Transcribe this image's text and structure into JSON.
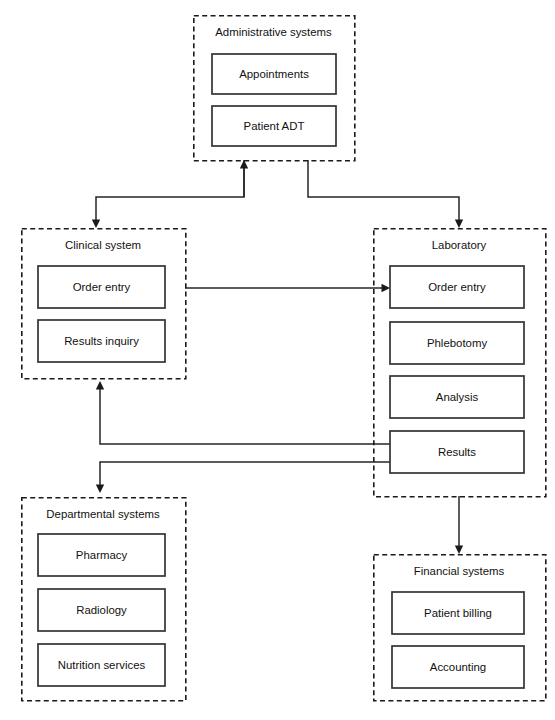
{
  "diagram": {
    "colors": {
      "background": "#ffffff",
      "group_border": "#1a1a1a",
      "node_border": "#333333",
      "node_fill": "#ffffff",
      "connector": "#262626",
      "text": "#111111"
    },
    "groups": [
      {
        "id": "administrative-systems",
        "title": "Administrative systems",
        "x": 193,
        "y": 15,
        "w": 161,
        "h": 145,
        "title_x": 273.5,
        "title_y": 33,
        "nodes": [
          {
            "id": "appointments",
            "label": "Appointments",
            "x": 212,
            "y": 54,
            "w": 124,
            "h": 40
          },
          {
            "id": "patient-adt",
            "label": "Patient ADT",
            "x": 212,
            "y": 106,
            "w": 124,
            "h": 40
          }
        ]
      },
      {
        "id": "clinical-system",
        "title": "Clinical system",
        "x": 21,
        "y": 228,
        "w": 164,
        "h": 150,
        "title_x": 103,
        "title_y": 246,
        "nodes": [
          {
            "id": "clinical-order-entry",
            "label": "Order entry",
            "x": 38,
            "y": 266,
            "w": 127,
            "h": 42
          },
          {
            "id": "results-inquiry",
            "label": "Results inquiry",
            "x": 38,
            "y": 320,
            "w": 127,
            "h": 42
          }
        ]
      },
      {
        "id": "laboratory",
        "title": "Laboratory",
        "x": 373,
        "y": 228,
        "w": 172,
        "h": 268,
        "title_x": 459,
        "title_y": 246,
        "nodes": [
          {
            "id": "lab-order-entry",
            "label": "Order entry",
            "x": 390,
            "y": 266,
            "w": 134,
            "h": 42
          },
          {
            "id": "phlebotomy",
            "label": "Phlebotomy",
            "x": 390,
            "y": 322,
            "w": 134,
            "h": 42
          },
          {
            "id": "analysis",
            "label": "Analysis",
            "x": 390,
            "y": 376,
            "w": 134,
            "h": 42
          },
          {
            "id": "results",
            "label": "Results",
            "x": 390,
            "y": 431,
            "w": 134,
            "h": 42
          }
        ]
      },
      {
        "id": "departmental-systems",
        "title": "Departmental systems",
        "x": 21,
        "y": 497,
        "w": 164,
        "h": 203,
        "title_x": 103,
        "title_y": 515,
        "nodes": [
          {
            "id": "pharmacy",
            "label": "Pharmacy",
            "x": 38,
            "y": 534,
            "w": 127,
            "h": 42
          },
          {
            "id": "radiology",
            "label": "Radiology",
            "x": 38,
            "y": 589,
            "w": 127,
            "h": 42
          },
          {
            "id": "nutrition-services",
            "label": "Nutrition services",
            "x": 38,
            "y": 644,
            "w": 127,
            "h": 42
          }
        ]
      },
      {
        "id": "financial-systems",
        "title": "Financial systems",
        "x": 373,
        "y": 554,
        "w": 172,
        "h": 146,
        "title_x": 459,
        "title_y": 572,
        "nodes": [
          {
            "id": "patient-billing",
            "label": "Patient billing",
            "x": 392,
            "y": 592,
            "w": 132,
            "h": 42
          },
          {
            "id": "accounting",
            "label": "Accounting",
            "x": 392,
            "y": 646,
            "w": 132,
            "h": 42
          }
        ]
      }
    ],
    "connectors": [
      {
        "id": "admin-to-clinical",
        "from": "administrative-systems",
        "to": "clinical-system",
        "path": "M 244 160 L 244 197 L 96 197 L 96 221",
        "arrow": {
          "x": 96,
          "y": 228,
          "dir": "down"
        }
      },
      {
        "id": "clinical-to-admin",
        "from": "clinical-system",
        "to": "administrative-systems",
        "path": "M 244 197 L 244 167",
        "arrow": {
          "x": 244,
          "y": 160,
          "dir": "up"
        }
      },
      {
        "id": "admin-to-laboratory",
        "from": "administrative-systems",
        "to": "laboratory",
        "path": "M 308 160 L 308 197 L 459 197 L 459 221",
        "arrow": {
          "x": 459,
          "y": 228,
          "dir": "down"
        }
      },
      {
        "id": "clinical-order-entry-to-lab-order-entry",
        "from": "clinical-order-entry",
        "to": "lab-order-entry",
        "path": "M 185 288 L 383 288",
        "arrow": {
          "x": 390,
          "y": 288,
          "dir": "right"
        }
      },
      {
        "id": "lab-results-to-clinical-system",
        "from": "results",
        "to": "clinical-system",
        "path": "M 390 444 L 100 444 L 100 389",
        "arrow": {
          "x": 100,
          "y": 381,
          "dir": "up"
        }
      },
      {
        "id": "lab-results-to-departmental-systems",
        "from": "results",
        "to": "departmental-systems",
        "path": "M 390 462 L 100 462 L 100 485",
        "arrow": {
          "x": 100,
          "y": 493,
          "dir": "down"
        }
      },
      {
        "id": "laboratory-to-financial-systems",
        "from": "laboratory",
        "to": "financial-systems",
        "path": "M 459 496 L 459 547",
        "arrow": {
          "x": 459,
          "y": 554,
          "dir": "down"
        }
      }
    ]
  }
}
